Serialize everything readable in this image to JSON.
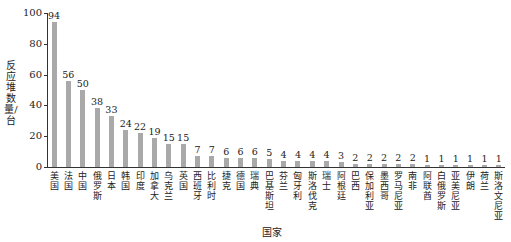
{
  "chart_data": {
    "type": "bar",
    "title": "",
    "xlabel": "国家",
    "ylabel": "反应堆数量/台",
    "ylim": [
      0,
      100
    ],
    "yticks": [
      0,
      20,
      40,
      60,
      80,
      100
    ],
    "grid": false,
    "legend": null,
    "categories": [
      "美国",
      "法国",
      "中国",
      "俄罗斯",
      "日本",
      "韩国",
      "印度",
      "加拿大",
      "乌克兰",
      "英国",
      "西班牙",
      "比利时",
      "捷克",
      "德国",
      "瑞典",
      "巴基斯坦",
      "芬兰",
      "匈牙利",
      "斯洛伐克",
      "瑞士",
      "阿根廷",
      "巴西",
      "保加利亚",
      "墨西哥",
      "罗马尼亚",
      "南非",
      "阿联酋",
      "白俄罗斯",
      "亚美尼亚",
      "伊朗",
      "荷兰",
      "斯洛文尼亚"
    ],
    "values": [
      94,
      56,
      50,
      38,
      33,
      24,
      22,
      19,
      15,
      15,
      7,
      7,
      6,
      6,
      6,
      5,
      4,
      4,
      4,
      4,
      3,
      2,
      2,
      2,
      2,
      2,
      1,
      1,
      1,
      1,
      1,
      1
    ],
    "bar_color": "#a9a9a9"
  }
}
